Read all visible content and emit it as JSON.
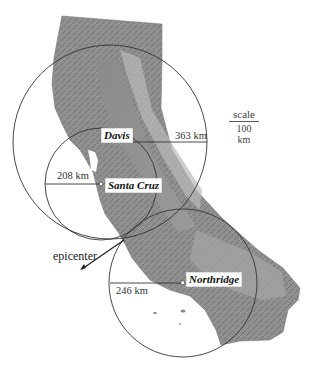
{
  "stations": [
    {
      "name": "Davis",
      "distance_label": "363 km",
      "distance_km": 363
    },
    {
      "name": "Santa Cruz",
      "distance_label": "208 km",
      "distance_km": 208
    },
    {
      "name": "Northridge",
      "distance_label": "246 km",
      "distance_km": 246
    }
  ],
  "epicenter": {
    "label": "epicenter"
  },
  "scale": {
    "word": "scale",
    "value": "100 km"
  },
  "colors": {
    "background": "#ffffff",
    "land_light": "#b5b5b5",
    "land_mid": "#8e8e8e",
    "land_dark": "#6a6a6a",
    "circle_stroke": "#333333"
  }
}
